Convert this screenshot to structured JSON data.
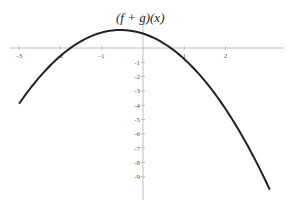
{
  "chart_data": {
    "type": "line",
    "title": "(f + g)(x)",
    "xlabel": "",
    "ylabel": "",
    "xlim": [
      -3.1,
      3.3
    ],
    "ylim": [
      -10,
      1.5
    ],
    "x_ticks": [
      -3,
      -2,
      -1,
      1,
      2
    ],
    "y_ticks": [
      -1,
      -2,
      -3,
      -4,
      -5,
      -6,
      -7,
      -8,
      -9
    ],
    "grid": false,
    "legend": null,
    "series": [
      {
        "name": "(f + g)(x)",
        "color": "#222222",
        "x": [
          -3,
          -2.5,
          -2,
          -1.5,
          -1,
          -0.5,
          0,
          0.5,
          1,
          1.5,
          2,
          2.5,
          3,
          3.07
        ],
        "y": [
          -3.9,
          -2.02,
          -0.56,
          0.47,
          1.08,
          1.26,
          1.01,
          0.33,
          -0.78,
          -2.32,
          -4.27,
          -6.65,
          -9.45,
          -9.9
        ]
      }
    ]
  },
  "labels": {
    "title": "(f + g)(x)"
  }
}
